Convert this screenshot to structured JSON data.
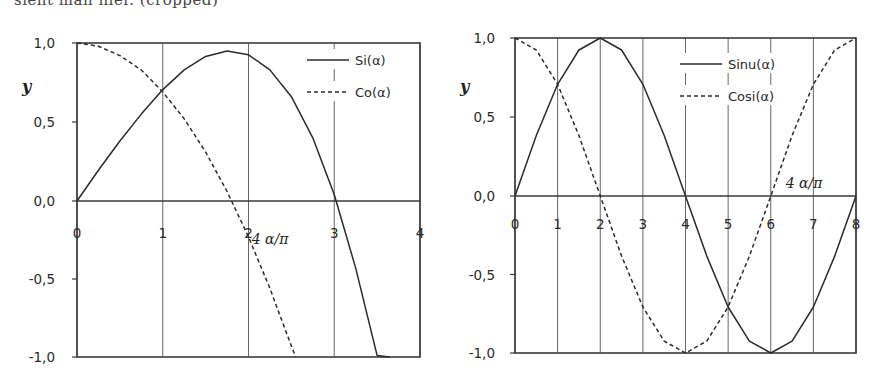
{
  "page": {
    "top_fragment": "sieht man hier. (cropped)"
  },
  "chart_data": [
    {
      "type": "line",
      "id": "left",
      "title": "",
      "xlabel": "4 α/π",
      "ylabel": "y",
      "xlim": [
        0,
        4
      ],
      "ylim": [
        -1.0,
        1.0
      ],
      "x_ticks": [
        "0",
        "1",
        "2",
        "3",
        "4"
      ],
      "y_ticks": [
        "1,0",
        "0,5",
        "0,0",
        "-0,5",
        "-1,0"
      ],
      "grid": "vertical",
      "legend_position": "upper-right",
      "series": [
        {
          "name": "Si(α)",
          "style": "solid",
          "x": [
            0,
            0.25,
            0.5,
            0.75,
            1.0,
            1.25,
            1.5,
            1.75,
            2.0,
            2.25,
            2.5,
            2.75,
            3.0,
            3.25,
            3.5,
            3.65
          ],
          "y": [
            0,
            0.195,
            0.38,
            0.55,
            0.705,
            0.83,
            0.915,
            0.95,
            0.925,
            0.83,
            0.66,
            0.4,
            0.04,
            -0.43,
            -0.99,
            -1.0
          ]
        },
        {
          "name": "Co(α)",
          "style": "dashed",
          "x": [
            0,
            0.25,
            0.5,
            0.75,
            1.0,
            1.25,
            1.5,
            1.75,
            2.0,
            2.25,
            2.5,
            2.55
          ],
          "y": [
            1.0,
            0.98,
            0.92,
            0.83,
            0.69,
            0.52,
            0.31,
            0.06,
            -0.23,
            -0.56,
            -0.93,
            -1.0
          ]
        }
      ]
    },
    {
      "type": "line",
      "id": "right",
      "title": "",
      "xlabel": "4 α/π",
      "ylabel": "y",
      "xlim": [
        0,
        8
      ],
      "ylim": [
        -1.0,
        1.0
      ],
      "x_ticks": [
        "0",
        "1",
        "2",
        "3",
        "4",
        "5",
        "6",
        "7",
        "8"
      ],
      "y_ticks": [
        "1,0",
        "0,5",
        "0,0",
        "-0,5",
        "-1,0"
      ],
      "grid": "vertical",
      "legend_position": "upper-right",
      "series": [
        {
          "name": "Sinu(α)",
          "style": "solid",
          "x": [
            0,
            0.5,
            1,
            1.5,
            2,
            2.5,
            3,
            3.5,
            4,
            4.5,
            5,
            5.5,
            6,
            6.5,
            7,
            7.5,
            8
          ],
          "y": [
            0,
            0.383,
            0.707,
            0.924,
            1.0,
            0.924,
            0.707,
            0.383,
            0,
            -0.383,
            -0.707,
            -0.924,
            -1.0,
            -0.924,
            -0.707,
            -0.383,
            0
          ]
        },
        {
          "name": "Cosi(α)",
          "style": "dashed",
          "x": [
            0,
            0.5,
            1,
            1.5,
            2,
            2.5,
            3,
            3.5,
            4,
            4.5,
            5,
            5.5,
            6,
            6.5,
            7,
            7.5,
            8
          ],
          "y": [
            1.0,
            0.924,
            0.707,
            0.383,
            0,
            -0.383,
            -0.707,
            -0.924,
            -1.0,
            -0.924,
            -0.707,
            -0.383,
            0,
            0.383,
            0.707,
            0.924,
            1.0
          ]
        }
      ]
    }
  ],
  "layout": {
    "left": {
      "x0": 77,
      "x1": 420,
      "y_top": 43,
      "y_zero": 201,
      "y_bot": 357,
      "legend_x": 307,
      "legend_y": 60,
      "xlabel_x": 270,
      "xlabel_y": 244,
      "ylabel_x": 22,
      "ylabel_y": 92,
      "tick_label_y": 238,
      "y_label_right": 55
    },
    "right": {
      "x0": 515,
      "x1": 856,
      "y_top": 38,
      "y_zero": 196,
      "y_bot": 353,
      "legend_x": 680,
      "legend_y": 64,
      "xlabel_x": 804,
      "xlabel_y": 188,
      "ylabel_x": 460,
      "ylabel_y": 92,
      "tick_label_y": 229,
      "y_label_right": 495
    }
  },
  "colors": {
    "line": "#2b2b2b",
    "grid": "#555555",
    "frame": "#3a3a3a"
  }
}
